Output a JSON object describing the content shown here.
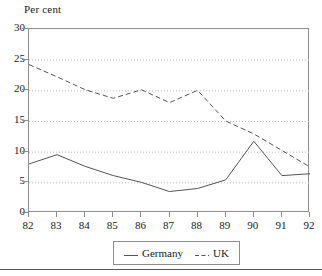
{
  "figure": {
    "yaxis_title": "Per cent",
    "axis_color": "#8d8d8d",
    "grid_color": "#bdbdbd",
    "series_color": "#545454",
    "rule_color": "#5a5a5a"
  },
  "legend": {
    "position": "bottom-center",
    "entries": [
      {
        "label": "Germany",
        "style": "solid",
        "swatch": "line-solid-swatch"
      },
      {
        "label": "UK",
        "style": "dashed",
        "swatch": "line-dashed-swatch"
      }
    ]
  },
  "chart_data": {
    "type": "line",
    "title": "",
    "subtitle": "",
    "xlabel": "",
    "ylabel": "Per cent",
    "categories": [
      "82",
      "83",
      "84",
      "85",
      "86",
      "87",
      "88",
      "89",
      "90",
      "91",
      "92"
    ],
    "x": [
      82,
      83,
      84,
      85,
      86,
      87,
      88,
      89,
      90,
      91,
      92
    ],
    "xlim": [
      82,
      92
    ],
    "ylim": [
      0,
      30
    ],
    "yticks": [
      0,
      5,
      10,
      15,
      20,
      25,
      30
    ],
    "ytick_labels": [
      "0",
      "5",
      "10",
      "15",
      "20",
      "25",
      "30"
    ],
    "xticks": [
      82,
      83,
      84,
      85,
      86,
      87,
      88,
      89,
      90,
      91,
      92
    ],
    "xtick_labels": [
      "82",
      "83",
      "84",
      "85",
      "86",
      "87",
      "88",
      "89",
      "90",
      "91",
      "92"
    ],
    "grid": true,
    "grid_axis": "y",
    "grid_style": "dotted",
    "legend_position": "bottom-center",
    "series": [
      {
        "name": "Germany",
        "style": "solid",
        "values": [
          8.0,
          9.5,
          7.6,
          6.1,
          5.0,
          3.5,
          4.0,
          5.4,
          11.7,
          6.1,
          6.4
        ]
      },
      {
        "name": "UK",
        "style": "dashed",
        "values": [
          24.2,
          22.2,
          20.1,
          18.7,
          20.1,
          18.0,
          20.0,
          15.0,
          12.9,
          10.2,
          7.5
        ]
      }
    ]
  }
}
